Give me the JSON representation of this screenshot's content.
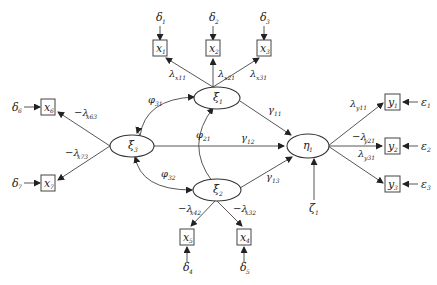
{
  "diagram": {
    "type": "structural-equation-model",
    "latent_exogenous": [
      {
        "id": "xi1",
        "symbol": "ξ",
        "sub": "1"
      },
      {
        "id": "xi2",
        "symbol": "ξ",
        "sub": "2"
      },
      {
        "id": "xi3",
        "symbol": "ξ",
        "sub": "3"
      }
    ],
    "latent_endogenous": [
      {
        "id": "eta1",
        "symbol": "η",
        "sub": "1"
      }
    ],
    "observed_x": [
      {
        "id": "x1",
        "symbol": "x",
        "sub": "1",
        "error": {
          "symbol": "δ",
          "sub": "1"
        }
      },
      {
        "id": "x2",
        "symbol": "x",
        "sub": "2",
        "error": {
          "symbol": "δ",
          "sub": "2"
        }
      },
      {
        "id": "x3",
        "symbol": "x",
        "sub": "3",
        "error": {
          "symbol": "δ",
          "sub": "3"
        }
      },
      {
        "id": "x4",
        "symbol": "x",
        "sub": "4",
        "error": {
          "symbol": "δ",
          "sub": "5"
        }
      },
      {
        "id": "x5",
        "symbol": "x",
        "sub": "5",
        "error": {
          "symbol": "δ",
          "sub": "4"
        }
      },
      {
        "id": "x6",
        "symbol": "x",
        "sub": "6",
        "error": {
          "symbol": "δ",
          "sub": "6"
        }
      },
      {
        "id": "x7",
        "symbol": "x",
        "sub": "7",
        "error": {
          "symbol": "δ",
          "sub": "7"
        }
      }
    ],
    "observed_y": [
      {
        "id": "y1",
        "symbol": "y",
        "sub": "1",
        "error": {
          "symbol": "ε",
          "sub": "1"
        }
      },
      {
        "id": "y2",
        "symbol": "y",
        "sub": "2",
        "error": {
          "symbol": "ε",
          "sub": "2"
        }
      },
      {
        "id": "y3",
        "symbol": "y",
        "sub": "3",
        "error": {
          "symbol": "ε",
          "sub": "3"
        }
      }
    ],
    "disturbance": {
      "symbol": "ζ",
      "sub": "1"
    },
    "loadings": [
      {
        "from": "xi1",
        "to": "x1",
        "sign": "",
        "symbol": "λ",
        "sub": "x11"
      },
      {
        "from": "xi1",
        "to": "x2",
        "sign": "",
        "symbol": "λ",
        "sub": "x21"
      },
      {
        "from": "xi1",
        "to": "x3",
        "sign": "",
        "symbol": "λ",
        "sub": "x31"
      },
      {
        "from": "xi2",
        "to": "x5",
        "sign": "−",
        "symbol": "λ",
        "sub": "x42"
      },
      {
        "from": "xi2",
        "to": "x4",
        "sign": "−",
        "symbol": "λ",
        "sub": "x32"
      },
      {
        "from": "xi3",
        "to": "x6",
        "sign": "−",
        "symbol": "λ",
        "sub": "x63"
      },
      {
        "from": "xi3",
        "to": "x7",
        "sign": "−",
        "symbol": "λ",
        "sub": "x73"
      },
      {
        "from": "eta1",
        "to": "y1",
        "sign": "",
        "symbol": "λ",
        "sub": "y11"
      },
      {
        "from": "eta1",
        "to": "y2",
        "sign": "−",
        "symbol": "λ",
        "sub": "y21"
      },
      {
        "from": "eta1",
        "to": "y3",
        "sign": "",
        "symbol": "λ",
        "sub": "y31"
      }
    ],
    "paths": [
      {
        "from": "xi1",
        "to": "eta1",
        "symbol": "γ",
        "sub": "11"
      },
      {
        "from": "xi3",
        "to": "eta1",
        "symbol": "γ",
        "sub": "12"
      },
      {
        "from": "xi2",
        "to": "eta1",
        "symbol": "γ",
        "sub": "13"
      }
    ],
    "covariances": [
      {
        "between": [
          "xi3",
          "xi1"
        ],
        "symbol": "φ",
        "sub": "31"
      },
      {
        "between": [
          "xi2",
          "xi1"
        ],
        "symbol": "φ",
        "sub": "21"
      },
      {
        "between": [
          "xi3",
          "xi2"
        ],
        "symbol": "φ",
        "sub": "32"
      }
    ]
  }
}
